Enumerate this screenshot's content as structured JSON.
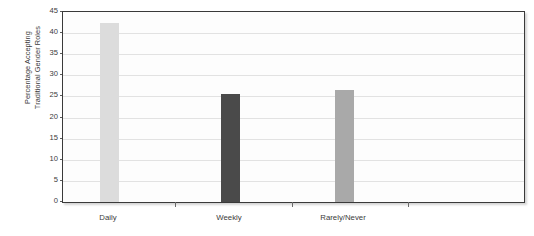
{
  "chart_data": {
    "type": "bar",
    "title": "",
    "xlabel": "",
    "ylabel": "Percentage Accepting Traditional Gender Roles",
    "ylabel_lines": [
      "Percentage Accepting",
      "Traditional Gender Roles"
    ],
    "categories": [
      "Daily",
      "Weekly",
      "Rarely/Never"
    ],
    "values": [
      42.4,
      25.7,
      26.6
    ],
    "bar_colors": [
      "#dcdcdc",
      "#4a4a4a",
      "#a9a9a9"
    ],
    "ylim": [
      0,
      45
    ],
    "yticks": [
      0,
      5,
      10,
      15,
      20,
      25,
      30,
      35,
      40,
      45
    ],
    "ytick_labels": [
      "0",
      "5",
      "10",
      "15",
      "20",
      "25",
      "30",
      "35",
      "40",
      "45"
    ],
    "grid": true,
    "grid_color": "#e2e2e2",
    "legend": null,
    "legend_position": "none",
    "axis_color": "#3a3a3a",
    "plot_background": "#fdfdfd",
    "figure_background": "#ffffff"
  }
}
